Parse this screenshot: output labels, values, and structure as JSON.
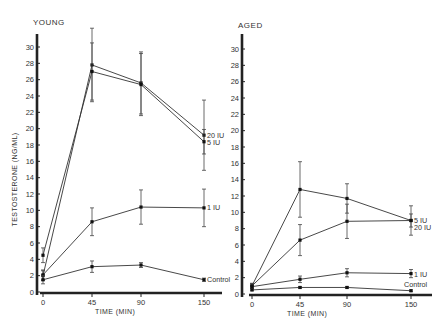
{
  "chart_data": [
    {
      "type": "line",
      "title": "YOUNG",
      "xlabel": "TIME (MIN)",
      "ylabel": "TESTOSTERONE (NG/ML)",
      "x": [
        0,
        45,
        90,
        150
      ],
      "xticks": [
        "0",
        "45",
        "90",
        "150"
      ],
      "yticks": [
        "0",
        "2",
        "4",
        "6",
        "8",
        "10",
        "12",
        "14",
        "16",
        "18",
        "20",
        "22",
        "24",
        "26",
        "28",
        "30"
      ],
      "ylim": [
        0,
        30
      ],
      "series": [
        {
          "name": "20 IU",
          "values": [
            2.0,
            27.8,
            25.6,
            19.2
          ],
          "err": [
            0.6,
            4.5,
            3.8,
            4.3
          ]
        },
        {
          "name": "5 IU",
          "values": [
            4.5,
            27.0,
            25.4,
            18.4
          ],
          "err": [
            0.9,
            3.5,
            3.8,
            1.5
          ]
        },
        {
          "name": "1 IU",
          "values": [
            2.1,
            8.6,
            10.4,
            10.3
          ],
          "err": [
            0.6,
            1.7,
            2.1,
            2.3
          ]
        },
        {
          "name": "Control",
          "values": [
            1.5,
            3.1,
            3.3,
            1.5
          ],
          "err": [
            0.5,
            0.7,
            0.3,
            0.2
          ]
        }
      ]
    },
    {
      "type": "line",
      "title": "AGED",
      "xlabel": "TIME (MIN)",
      "ylabel": "",
      "x": [
        0,
        45,
        90,
        150
      ],
      "xticks": [
        "0",
        "45",
        "90",
        "150"
      ],
      "yticks": [
        "0",
        "2",
        "4",
        "6",
        "8",
        "10",
        "12",
        "14",
        "16",
        "18",
        "20",
        "22",
        "24",
        "26",
        "28",
        "30"
      ],
      "ylim": [
        0,
        30
      ],
      "series": [
        {
          "name": "5 IU",
          "values": [
            1.0,
            12.8,
            11.7,
            9.0
          ],
          "err": [
            0.3,
            3.4,
            1.8,
            1.8
          ]
        },
        {
          "name": "20 IU",
          "values": [
            1.0,
            6.6,
            8.9,
            9.0
          ],
          "err": [
            0.3,
            1.9,
            2.1,
            0.8
          ]
        },
        {
          "name": "1 IU",
          "values": [
            0.9,
            1.8,
            2.6,
            2.5
          ],
          "err": [
            0.2,
            0.4,
            0.5,
            0.5
          ]
        },
        {
          "name": "Control",
          "values": [
            0.5,
            0.8,
            0.8,
            0.4
          ],
          "err": [
            0.1,
            0.1,
            0.1,
            0.1
          ]
        }
      ]
    }
  ]
}
